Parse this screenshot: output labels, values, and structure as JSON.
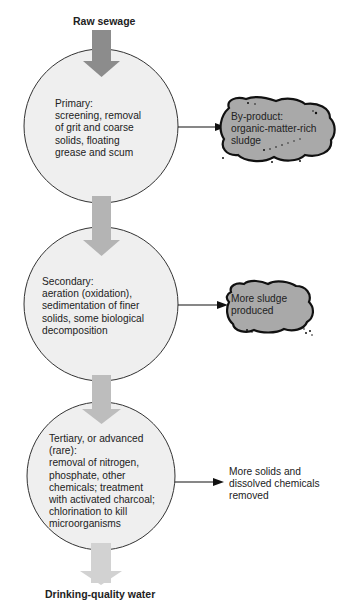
{
  "input_label": "Raw sewage",
  "output_label": "Drinking-quality water",
  "colors": {
    "circle_fill": "#efefef",
    "circle_stroke": "#333333",
    "arrow_dark": "#8c8c8c",
    "arrow_mid": "#b4b4b4",
    "arrow_light": "#cfcfcf",
    "sludge_fill": "#a9a9a9",
    "sludge_stroke": "#111111"
  },
  "stages": [
    {
      "name": "Primary",
      "lines": [
        "Primary:",
        "screening, removal",
        "of grit and coarse",
        "solids, floating",
        "grease and scum"
      ],
      "byproduct": {
        "style": "sludge-blob",
        "lines": [
          "By-product:",
          "organic-matter-rich",
          "sludge"
        ]
      }
    },
    {
      "name": "Secondary",
      "lines": [
        "Secondary:",
        "aeration (oxidation),",
        "sedimentation of finer",
        "solids, some biological",
        "decomposition"
      ],
      "byproduct": {
        "style": "sludge-blob",
        "lines": [
          "More sludge",
          "produced"
        ]
      }
    },
    {
      "name": "Tertiary",
      "lines": [
        "Tertiary, or advanced",
        "(rare):",
        "removal of nitrogen,",
        "phosphate, other",
        "chemicals; treatment",
        "with activated charcoal;",
        "chlorination to kill",
        "microorganisms"
      ],
      "byproduct": {
        "style": "text",
        "lines": [
          "More solids and",
          "dissolved chemicals",
          "removed"
        ]
      }
    }
  ]
}
